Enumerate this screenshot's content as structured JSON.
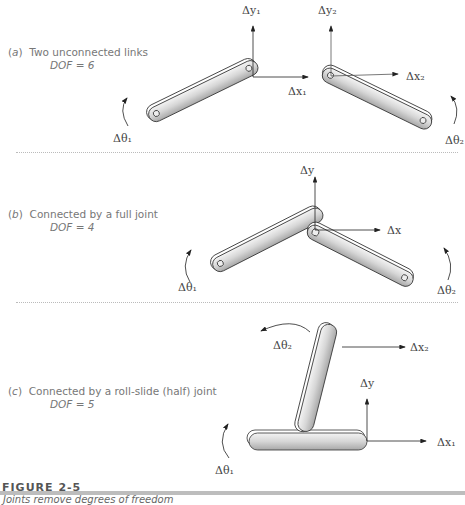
{
  "panels": [
    {
      "letter": "a",
      "title": "Two unconnected links",
      "dof_label": "DOF = 6",
      "symbols": {
        "dy1": "Δy₁",
        "dy2": "Δy₂",
        "dx1": "Δx₁",
        "dx2": "Δx₂",
        "dt1": "Δθ₁",
        "dt2": "Δθ₂"
      }
    },
    {
      "letter": "b",
      "title": "Connected by a full joint",
      "dof_label": "DOF = 4",
      "symbols": {
        "dy": "Δy",
        "dx": "Δx",
        "dt1": "Δθ₁",
        "dt2": "Δθ₂"
      }
    },
    {
      "letter": "c",
      "title": "Connected by a roll-slide (half) joint",
      "dof_label": "DOF = 5",
      "symbols": {
        "dt2": "Δθ₂",
        "dx2": "Δx₂",
        "dy": "Δy",
        "dx1": "Δx₁",
        "dt1": "Δθ₁"
      }
    }
  ],
  "figure": {
    "number": "FIGURE 2-5",
    "caption": "Joints remove degrees of freedom"
  },
  "colors": {
    "link_fill": "#d8d8d8",
    "link_stroke": "#333333",
    "text": "#777777",
    "bar": "#bdbdbd"
  }
}
